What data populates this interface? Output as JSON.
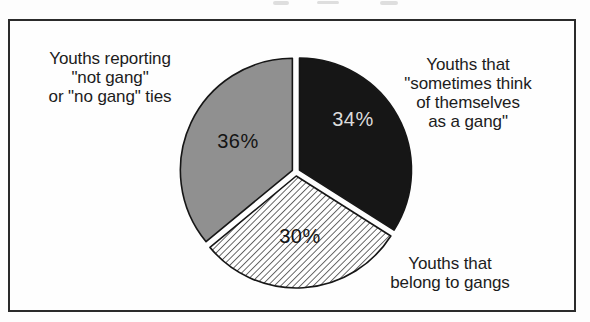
{
  "figure": {
    "background": "#fdfdfd",
    "frame_border_color": "#2b2b2b"
  },
  "chart_data": {
    "type": "pie",
    "title": "",
    "start_angle_deg": 90,
    "direction": "clockwise",
    "legend_position": "none",
    "slices": [
      {
        "label": "Youths that \"sometimes think of themselves as a gang\"",
        "value": 34,
        "display": "34%",
        "style": "solid-black",
        "color": "#161616",
        "text_color": "#dcdcdc"
      },
      {
        "label": "Youths that belong to gangs",
        "value": 30,
        "display": "30%",
        "style": "diagonal-hatch",
        "color": "#ffffff",
        "hatch_color": "#1a1a1a",
        "text_color": "#141414"
      },
      {
        "label": "Youths reporting \"not gang\" or \"no gang\" ties",
        "value": 36,
        "display": "36%",
        "style": "solid-gray",
        "color": "#909090",
        "text_color": "#141414"
      }
    ],
    "annotations": {
      "left_label": {
        "lines": [
          "Youths reporting",
          "\"not gang\"",
          "or \"no gang\" ties"
        ]
      },
      "right_label": {
        "lines": [
          "Youths that",
          "\"sometimes think",
          "of themselves",
          "as a gang\""
        ]
      },
      "bottom_label": {
        "lines": [
          "Youths that",
          "belong to gangs"
        ]
      }
    }
  }
}
